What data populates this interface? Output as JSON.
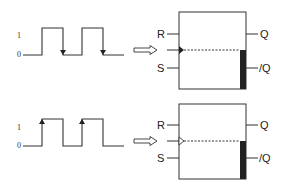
{
  "diagrams": [
    {
      "id": "top",
      "title": "Falling-edge triggered flip-flop",
      "waveform": {
        "level_high_label": "1",
        "level_low_label": "0",
        "edge_markers": "falling"
      },
      "flipflop": {
        "inputs": [
          "R",
          "S"
        ],
        "outputs": [
          "Q",
          "/Q"
        ],
        "clock_symbol": "filled-triangle"
      }
    },
    {
      "id": "bottom",
      "title": "Rising-edge triggered flip-flop",
      "waveform": {
        "level_high_label": "1",
        "level_low_label": "0",
        "edge_markers": "rising"
      },
      "flipflop": {
        "inputs": [
          "R",
          "S"
        ],
        "outputs": [
          "Q",
          "/Q"
        ],
        "clock_symbol": "hollow-triangle"
      }
    }
  ],
  "colors": {
    "stroke": "#333333",
    "bar": "#222222",
    "background": "#ffffff"
  }
}
